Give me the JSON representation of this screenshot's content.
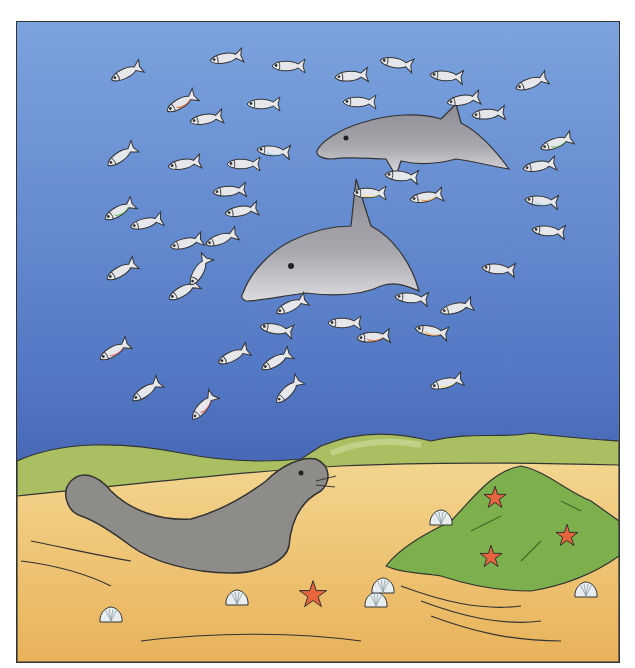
{
  "scene": {
    "title": "Underwater seashore illustration",
    "colors": {
      "water_top": "#7aa0dc",
      "water_bottom": "#2f4a98",
      "sand": "#f0c878",
      "sand_dark": "#e3a84e",
      "hills": "#a8c060",
      "moss": "#7db04c",
      "dolphin": "#9a9a9e",
      "seal": "#8e8c88",
      "starfish": "#e8643c",
      "shell": "#e8eef0"
    },
    "fish": [
      {
        "x": 125,
        "y": 72,
        "r": -25,
        "band": ""
      },
      {
        "x": 225,
        "y": 57,
        "r": -10,
        "band": ""
      },
      {
        "x": 287,
        "y": 65,
        "r": 0,
        "band": ""
      },
      {
        "x": 180,
        "y": 102,
        "r": -30,
        "band": "#e05a30"
      },
      {
        "x": 205,
        "y": 118,
        "r": -10,
        "band": ""
      },
      {
        "x": 262,
        "y": 103,
        "r": 0,
        "band": ""
      },
      {
        "x": 120,
        "y": 155,
        "r": -35,
        "band": ""
      },
      {
        "x": 183,
        "y": 163,
        "r": -10,
        "band": ""
      },
      {
        "x": 242,
        "y": 163,
        "r": 0,
        "band": ""
      },
      {
        "x": 272,
        "y": 150,
        "r": 5,
        "band": "#8ad0f0"
      },
      {
        "x": 228,
        "y": 190,
        "r": -5,
        "band": ""
      },
      {
        "x": 240,
        "y": 210,
        "r": -10,
        "band": ""
      },
      {
        "x": 118,
        "y": 210,
        "r": -30,
        "band": "#70c060"
      },
      {
        "x": 145,
        "y": 222,
        "r": -15,
        "band": ""
      },
      {
        "x": 185,
        "y": 242,
        "r": -15,
        "band": ""
      },
      {
        "x": 220,
        "y": 238,
        "r": -20,
        "band": ""
      },
      {
        "x": 120,
        "y": 270,
        "r": -30,
        "band": ""
      },
      {
        "x": 182,
        "y": 290,
        "r": -30,
        "band": ""
      },
      {
        "x": 198,
        "y": 270,
        "r": -60,
        "band": ""
      },
      {
        "x": 350,
        "y": 75,
        "r": -5,
        "band": ""
      },
      {
        "x": 395,
        "y": 62,
        "r": 10,
        "band": ""
      },
      {
        "x": 445,
        "y": 75,
        "r": 5,
        "band": ""
      },
      {
        "x": 358,
        "y": 101,
        "r": 0,
        "band": ""
      },
      {
        "x": 462,
        "y": 99,
        "r": -10,
        "band": ""
      },
      {
        "x": 487,
        "y": 113,
        "r": -5,
        "band": ""
      },
      {
        "x": 530,
        "y": 82,
        "r": -20,
        "band": ""
      },
      {
        "x": 555,
        "y": 142,
        "r": -20,
        "band": "#70c060"
      },
      {
        "x": 538,
        "y": 165,
        "r": -10,
        "band": ""
      },
      {
        "x": 540,
        "y": 200,
        "r": 5,
        "band": "#8ad0f0"
      },
      {
        "x": 547,
        "y": 230,
        "r": 5,
        "band": ""
      },
      {
        "x": 368,
        "y": 192,
        "r": 0,
        "band": "#f0e070"
      },
      {
        "x": 425,
        "y": 196,
        "r": -10,
        "band": "#f0a050"
      },
      {
        "x": 400,
        "y": 175,
        "r": 5,
        "band": ""
      },
      {
        "x": 497,
        "y": 268,
        "r": 5,
        "band": ""
      },
      {
        "x": 410,
        "y": 297,
        "r": 5,
        "band": ""
      },
      {
        "x": 455,
        "y": 307,
        "r": -15,
        "band": ""
      },
      {
        "x": 290,
        "y": 305,
        "r": -25,
        "band": ""
      },
      {
        "x": 275,
        "y": 328,
        "r": 10,
        "band": ""
      },
      {
        "x": 343,
        "y": 322,
        "r": 0,
        "band": ""
      },
      {
        "x": 372,
        "y": 336,
        "r": -5,
        "band": "#e86838"
      },
      {
        "x": 430,
        "y": 330,
        "r": 10,
        "band": "#f0a050"
      },
      {
        "x": 232,
        "y": 355,
        "r": -25,
        "band": ""
      },
      {
        "x": 275,
        "y": 360,
        "r": -30,
        "band": ""
      },
      {
        "x": 113,
        "y": 350,
        "r": -30,
        "band": "#e07080"
      },
      {
        "x": 145,
        "y": 390,
        "r": -35,
        "band": ""
      },
      {
        "x": 202,
        "y": 406,
        "r": -50,
        "band": "#e07080"
      },
      {
        "x": 287,
        "y": 390,
        "r": -45,
        "band": ""
      },
      {
        "x": 445,
        "y": 382,
        "r": -15,
        "band": "#f0e070"
      }
    ],
    "starfish": [
      {
        "x": 312,
        "y": 594,
        "s": 1.1
      },
      {
        "x": 494,
        "y": 497,
        "s": 0.9
      },
      {
        "x": 566,
        "y": 535,
        "s": 0.9
      },
      {
        "x": 490,
        "y": 556,
        "s": 0.9
      }
    ],
    "shells": [
      {
        "x": 110,
        "y": 617
      },
      {
        "x": 236,
        "y": 600
      },
      {
        "x": 375,
        "y": 602
      },
      {
        "x": 440,
        "y": 520
      },
      {
        "x": 382,
        "y": 588
      },
      {
        "x": 585,
        "y": 592
      }
    ]
  }
}
